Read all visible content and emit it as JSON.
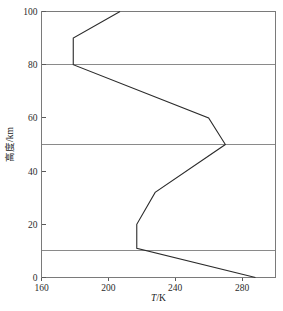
{
  "chart_data": {
    "type": "line",
    "title": "",
    "subtitle": "",
    "xlabel": "T/K",
    "xlabel_italic_part": "T",
    "xlabel_rest": "/K",
    "ylabel": "高度/km",
    "xlim": [
      160,
      300
    ],
    "ylim": [
      0,
      100
    ],
    "xticks": [
      160,
      200,
      240,
      280
    ],
    "xtick_labels": [
      "160",
      "200",
      "240",
      "280"
    ],
    "yticks": [
      0,
      20,
      40,
      60,
      80,
      100
    ],
    "ytick_labels": [
      "0",
      "20",
      "40",
      "60",
      "80",
      "100"
    ],
    "grid": true,
    "gridlines_y": [
      10,
      50,
      80
    ],
    "legend": null,
    "legend_position": "none",
    "series": [
      {
        "name": "标准大气温度廓线",
        "x_name": "T/K",
        "y_name": "高度/km",
        "points": [
          [
            288,
            0
          ],
          [
            217,
            11
          ],
          [
            217,
            20
          ],
          [
            228,
            32
          ],
          [
            270,
            50
          ],
          [
            260,
            60
          ],
          [
            179,
            80
          ],
          [
            179,
            90
          ],
          [
            207,
            100
          ]
        ]
      }
    ],
    "annotations": [],
    "colors": {
      "series_line": "#2b2b2b",
      "frame": "#7a7a7a",
      "gridline": "#8a8a8a",
      "text": "#1a1a1a",
      "background": "#ffffff"
    }
  }
}
